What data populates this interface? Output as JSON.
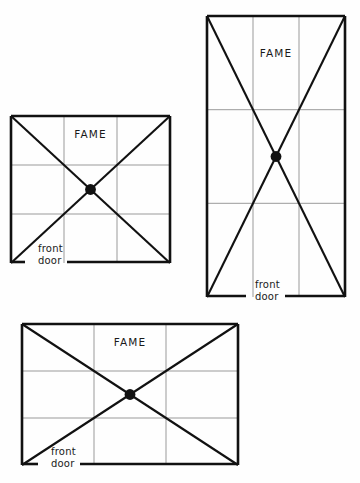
{
  "page": {
    "background_color": "#fefefe",
    "ink_color": "#111111",
    "grid_line_color": "#9a9a9a"
  },
  "diagrams": [
    {
      "id": "square-plan",
      "shape": "square",
      "x": 11,
      "y": 116,
      "width": 159,
      "height": 147,
      "grid_rows": 3,
      "grid_cols": 3,
      "fame_label": "FAME",
      "fame_cell": "top-center",
      "front_door_label_line1": "front",
      "front_door_label_line2": "door",
      "front_door_position": "bottom-left-corner",
      "center_dot": true,
      "diagonals": true
    },
    {
      "id": "tall-rectangle-plan",
      "shape": "tall-rectangle",
      "x": 207,
      "y": 16,
      "width": 138,
      "height": 281,
      "grid_rows": 3,
      "grid_cols": 3,
      "fame_label": "FAME",
      "fame_cell": "top-center",
      "front_door_label_line1": "front",
      "front_door_label_line2": "door",
      "front_door_position": "bottom-center",
      "center_dot": true,
      "diagonals": true
    },
    {
      "id": "wide-rectangle-plan",
      "shape": "wide-rectangle",
      "x": 22,
      "y": 324,
      "width": 216,
      "height": 141,
      "grid_rows": 3,
      "grid_cols": 3,
      "fame_label": "FAME",
      "fame_cell": "top-center",
      "front_door_label_line1": "front",
      "front_door_label_line2": "door",
      "front_door_position": "bottom-left-corner",
      "center_dot": true,
      "diagonals": true
    }
  ]
}
